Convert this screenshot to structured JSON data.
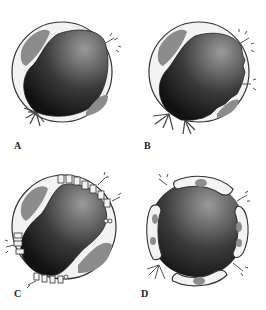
{
  "figure": {
    "panels": [
      {
        "id": "A",
        "label": "A",
        "description": "capillary cross-section, continuous endothelium with intact lining"
      },
      {
        "id": "B",
        "label": "B",
        "description": "capillary cross-section with irregular, ruffled luminal border and leaking sites"
      },
      {
        "id": "C",
        "label": "C",
        "description": "capillary cross-section with vesicles and channels along the endothelium"
      },
      {
        "id": "D",
        "label": "D",
        "description": "capillary cross-section with separated endothelial cells and gaps"
      }
    ]
  },
  "colors": {
    "lumen_dark": "#1a1a1a",
    "lumen_light": "#8a8a8a",
    "cell_fill": "#f2f2f2",
    "cell_outline": "#333333",
    "nucleus": "#8c8c8c"
  }
}
